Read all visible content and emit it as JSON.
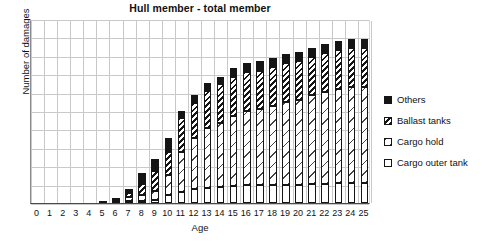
{
  "chart_data": {
    "type": "bar",
    "title": "Hull member - total member",
    "xlabel": "Age",
    "ylabel": "Number of damages",
    "stacked": true,
    "grid": true,
    "legend_position": "right",
    "ylim": [
      0,
      10
    ],
    "y_tick_labels": [],
    "categories": [
      "0",
      "1",
      "2",
      "3",
      "4",
      "5",
      "6",
      "7",
      "8",
      "9",
      "10",
      "11",
      "12",
      "13",
      "14",
      "15",
      "16",
      "17",
      "18",
      "19",
      "20",
      "21",
      "22",
      "23",
      "24",
      "25"
    ],
    "series": [
      {
        "name": "Cargo outer tank",
        "values": [
          0,
          0,
          0,
          0,
          0,
          0,
          0,
          0.05,
          0.1,
          0.15,
          0.45,
          0.6,
          0.75,
          0.8,
          0.85,
          0.95,
          1.0,
          1.0,
          1.0,
          1.0,
          1.0,
          1.05,
          1.05,
          1.1,
          1.1,
          1.1
        ]
      },
      {
        "name": "Cargo hold",
        "values": [
          0,
          0,
          0,
          0,
          0,
          0,
          0,
          0.2,
          0.35,
          0.5,
          1.1,
          2.2,
          2.8,
          3.3,
          3.5,
          3.8,
          4.0,
          4.1,
          4.3,
          4.5,
          4.6,
          4.8,
          5.0,
          5.1,
          5.2,
          5.2
        ]
      },
      {
        "name": "Ballast tanks",
        "values": [
          0,
          0,
          0,
          0,
          0,
          0,
          0.05,
          0.25,
          0.6,
          1.1,
          1.2,
          1.8,
          1.9,
          2.0,
          2.1,
          2.1,
          2.1,
          2.1,
          2.1,
          2.1,
          2.1,
          2.1,
          2.1,
          2.1,
          2.1,
          2.1
        ]
      },
      {
        "name": "Others",
        "values": [
          0,
          0,
          0,
          0,
          0,
          0.1,
          0.15,
          0.2,
          0.55,
          0.65,
          0.8,
          0.4,
          0.4,
          0.4,
          0.4,
          0.5,
          0.5,
          0.5,
          0.5,
          0.5,
          0.5,
          0.5,
          0.5,
          0.5,
          0.5,
          0.5
        ]
      }
    ],
    "totals": [
      0,
      0,
      0,
      0,
      0,
      0.1,
      0.2,
      0.7,
      1.6,
      2.4,
      3.55,
      5.0,
      5.85,
      6.5,
      6.85,
      7.35,
      7.6,
      7.7,
      7.9,
      8.1,
      8.2,
      8.45,
      8.65,
      8.8,
      8.9,
      8.9
    ]
  },
  "legend": {
    "items": [
      {
        "label": "Others",
        "swatch": "solid-black",
        "color": "#151515"
      },
      {
        "label": "Ballast tanks",
        "swatch": "dense-diagonal-hatch",
        "color": "#151515"
      },
      {
        "label": "Cargo hold",
        "swatch": "sparse-diagonal-hatch",
        "color": "#444444"
      },
      {
        "label": "Cargo outer tank",
        "swatch": "empty-white",
        "color": "#ffffff"
      }
    ]
  },
  "axes": {
    "grid_color": "#c9c9c9",
    "axis_color": "#4a4a4a",
    "y_gridline_count": 10,
    "x_tick_count": 26
  }
}
